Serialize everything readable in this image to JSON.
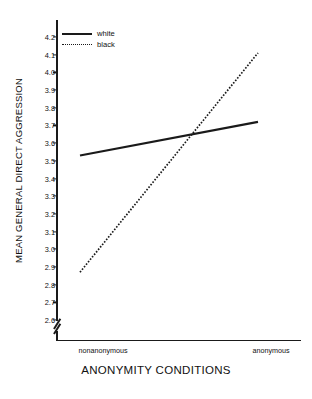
{
  "chart_data": {
    "type": "line",
    "title": "",
    "xlabel": "ANONYMITY CONDITIONS",
    "ylabel": "MEAN GENERAL DIRECT AGGRESSION",
    "categories": [
      "nonanonymous",
      "anonymous"
    ],
    "series": [
      {
        "name": "white",
        "style": "solid",
        "values": [
          3.53,
          3.72
        ]
      },
      {
        "name": "black",
        "style": "dotted",
        "values": [
          2.87,
          4.11
        ]
      }
    ],
    "ylim": [
      2.6,
      4.2
    ],
    "ytick_step": 0.1,
    "yticks": [
      "4.2",
      "4.1",
      "4.0",
      "3.9",
      "3.8",
      "3.7",
      "3.6",
      "3.5",
      "3.4",
      "3.3",
      "3.2",
      "3.1",
      "3.0",
      "2.9",
      "2.8",
      "2.7",
      "2.6"
    ],
    "ytick_values": [
      4.2,
      4.1,
      4.0,
      3.9,
      3.8,
      3.7,
      3.6,
      3.5,
      3.4,
      3.3,
      3.2,
      3.1,
      3.0,
      2.9,
      2.8,
      2.7,
      2.6
    ],
    "grid": false,
    "axis_break": true,
    "legend_position": "top-left",
    "legend": [
      "white",
      "black"
    ],
    "line_color": "#1a1a1a"
  },
  "axes": {
    "y_title": "MEAN GENERAL DIRECT AGGRESSION",
    "x_title": "ANONYMITY CONDITIONS",
    "x_tick_left": "nonanonymous",
    "x_tick_right": "anonymous"
  },
  "legend": {
    "items": [
      {
        "label": "white",
        "style": "solid"
      },
      {
        "label": "black",
        "style": "dotted"
      }
    ]
  },
  "icons": {
    "axis_break": "axis-break-icon"
  }
}
